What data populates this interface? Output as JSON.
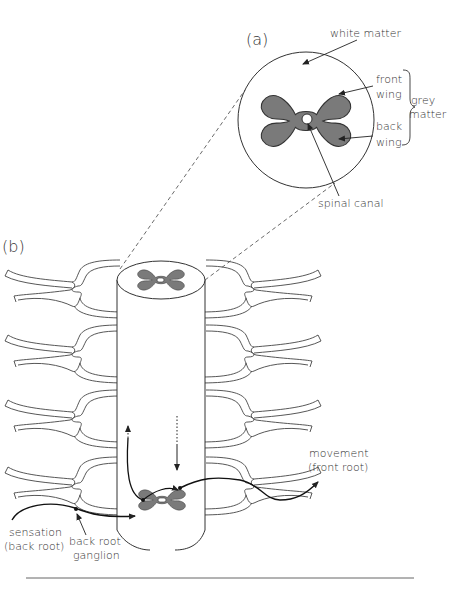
{
  "figure": {
    "panel_a_label": "(a)",
    "panel_b_label": "(b)",
    "cross_section": {
      "labels": {
        "white_matter": "white matter",
        "front_wing_1": "front",
        "front_wing_2": "wing",
        "back_wing_1": "back",
        "back_wing_2": "wing",
        "grey_matter_1": "grey",
        "grey_matter_2": "matter",
        "spinal_canal": "spinal canal"
      }
    },
    "spinal_cord": {
      "labels": {
        "movement_1": "movement",
        "movement_2": "(front root)",
        "sensation_1": "sensation",
        "sensation_2": "(back root)",
        "ganglion_1": "back root",
        "ganglion_2": "ganglion"
      },
      "nerve_pairs": 4
    },
    "colors": {
      "grey_matter": "#7a7a7a",
      "line": "#333333",
      "background": "#ffffff"
    }
  }
}
